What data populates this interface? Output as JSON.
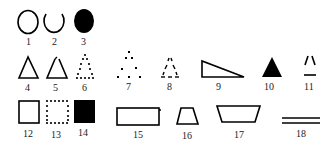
{
  "figure": {
    "ink_color": "#000000",
    "background": "#ffffff",
    "items": [
      {
        "label": "1",
        "shape": "circle-outline"
      },
      {
        "label": "2",
        "shape": "circle-open-top"
      },
      {
        "label": "3",
        "shape": "circle-filled"
      },
      {
        "label": "4",
        "shape": "triangle-outline"
      },
      {
        "label": "5",
        "shape": "triangle-outline-open-apex"
      },
      {
        "label": "6",
        "shape": "triangle-dotted"
      },
      {
        "label": "7",
        "shape": "triangle-sparse-dots"
      },
      {
        "label": "8",
        "shape": "triangle-dashes"
      },
      {
        "label": "9",
        "shape": "right-triangle-outline"
      },
      {
        "label": "10",
        "shape": "triangle-filled"
      },
      {
        "label": "11",
        "shape": "triangle-corners-only"
      },
      {
        "label": "12",
        "shape": "square-outline"
      },
      {
        "label": "13",
        "shape": "square-dotted"
      },
      {
        "label": "14",
        "shape": "square-filled"
      },
      {
        "label": "15",
        "shape": "rectangle-outline"
      },
      {
        "label": "16",
        "shape": "trapezoid-outline"
      },
      {
        "label": "17",
        "shape": "inverted-trapezoid-outline"
      },
      {
        "label": "18",
        "shape": "double-line"
      }
    ]
  }
}
